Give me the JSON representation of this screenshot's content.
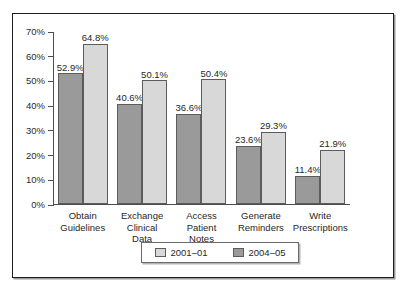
{
  "chart_data": {
    "type": "bar",
    "title": "",
    "subtitle": "",
    "xlabel": "",
    "ylabel": "",
    "ylim": [
      0,
      70
    ],
    "ytick_labels": [
      "0%",
      "10%",
      "20%",
      "30%",
      "40%",
      "50%",
      "60%",
      "70%"
    ],
    "ytick_values": [
      0,
      10,
      20,
      30,
      40,
      50,
      60,
      70
    ],
    "grid": false,
    "legend_position": "bottom-center",
    "categories": [
      "Obtain Guidelines",
      "Exchange Clinical Data",
      "Access Patient Notes",
      "Generate Reminders",
      "Write Prescriptions"
    ],
    "category_lines": [
      [
        "Obtain",
        "Guidelines"
      ],
      [
        "Exchange",
        "Clinical",
        "Data"
      ],
      [
        "Access",
        "Patient",
        "Notes"
      ],
      [
        "Generate",
        "Reminders"
      ],
      [
        "Write",
        "Prescriptions"
      ]
    ],
    "series": [
      {
        "name": "2004-05",
        "style": "dark",
        "color": "#9a9a9a",
        "values": [
          52.9,
          40.6,
          36.6,
          23.6,
          11.4
        ],
        "labels": [
          "52.9%",
          "40.6%",
          "36.6%",
          "23.6%",
          "11.4%"
        ]
      },
      {
        "name": "2001-01",
        "style": "light",
        "color": "#d8d8d8",
        "values": [
          64.8,
          50.1,
          50.4,
          29.3,
          21.9
        ],
        "labels": [
          "64.8%",
          "50.1%",
          "50.4%",
          "29.3%",
          "21.9%"
        ]
      }
    ]
  },
  "legend": {
    "entries": [
      {
        "label": "2001–01",
        "style": "light",
        "color": "#d8d8d8"
      },
      {
        "label": "2004–05",
        "style": "dark",
        "color": "#9a9a9a"
      }
    ]
  }
}
